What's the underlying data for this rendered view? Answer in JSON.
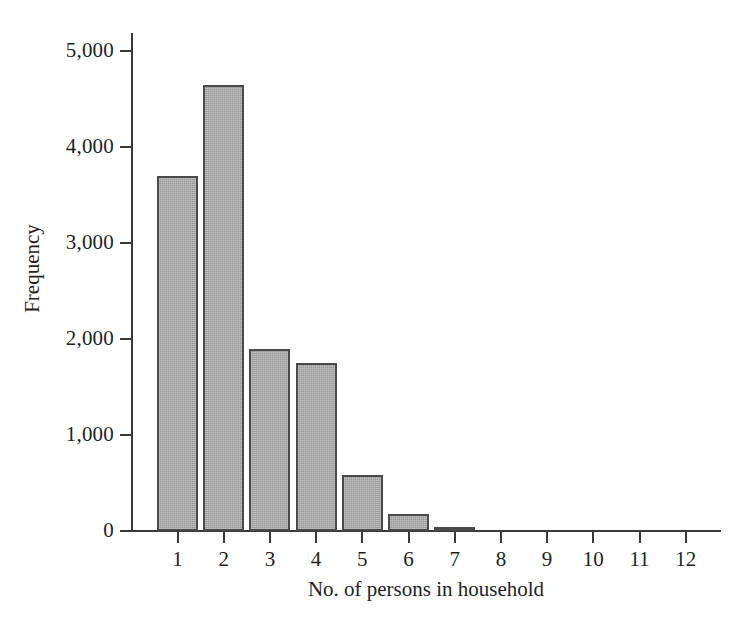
{
  "chart_data": {
    "type": "bar",
    "title": "",
    "xlabel": "No. of persons in household",
    "ylabel": "Frequency",
    "categories": [
      "1",
      "2",
      "3",
      "4",
      "5",
      "6",
      "7",
      "8",
      "9",
      "10",
      "11",
      "12"
    ],
    "values": [
      3700,
      4650,
      1900,
      1750,
      580,
      175,
      45,
      12,
      0,
      0,
      0,
      0
    ],
    "ylim": [
      0,
      5200
    ],
    "yticks": [
      0,
      1000,
      2000,
      3000,
      4000,
      5000
    ],
    "ytick_labels": [
      "0",
      "1,000",
      "2,000",
      "3,000",
      "4,000",
      "5,000"
    ],
    "grid": false,
    "legend": "none",
    "bar_color": "#a9a9a9",
    "bar_edge_color": "#4a4a4a",
    "axis_color": "#3a3a3a"
  }
}
